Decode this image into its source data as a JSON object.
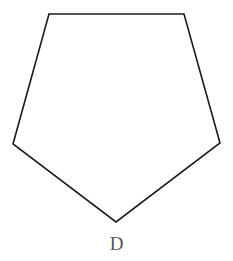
{
  "figure": {
    "type": "polygon",
    "name": "pentagon",
    "label": "D",
    "label_position": "below-bottom-vertex",
    "canvas": {
      "width": 233,
      "height": 261,
      "background_color": "#ffffff"
    },
    "stroke_color": "#1b1b1b",
    "stroke_width": 1.6,
    "fill": "none",
    "label_color": "#555555",
    "vertex_count": 5,
    "vertices": [
      {
        "name": "top-left",
        "x": 49,
        "y": 14
      },
      {
        "name": "top-right",
        "x": 184,
        "y": 14
      },
      {
        "name": "right",
        "x": 220,
        "y": 143
      },
      {
        "name": "bottom",
        "x": 116,
        "y": 222
      },
      {
        "name": "left",
        "x": 13,
        "y": 144
      }
    ],
    "points_string": "49,14 184,14 220,143 116,222 13,144"
  }
}
